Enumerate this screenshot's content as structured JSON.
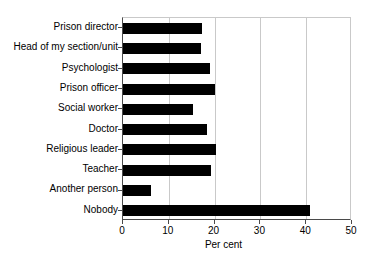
{
  "chart_data": {
    "type": "bar",
    "orientation": "horizontal",
    "title": "",
    "subtitle": "",
    "xlabel": "Per cent",
    "ylabel": "",
    "xlim": [
      0,
      50
    ],
    "xticks": [
      0,
      10,
      20,
      30,
      40,
      50
    ],
    "xtick_labels": [
      "0",
      "10",
      "20",
      "30",
      "40",
      "50"
    ],
    "grid": "vertical",
    "legend": null,
    "bar_color": "#000000",
    "grid_color": "#c9c9c9",
    "axis_color": "#4a4a4a",
    "categories": [
      "Prison director",
      "Head of my section/unit",
      "Psychologist",
      "Prison officer",
      "Social worker",
      "Doctor",
      "Religious leader",
      "Teacher",
      "Another person",
      "Nobody"
    ],
    "values": [
      17.3,
      17.0,
      19.0,
      20.1,
      15.2,
      18.3,
      20.3,
      19.2,
      6.2,
      40.8
    ]
  }
}
